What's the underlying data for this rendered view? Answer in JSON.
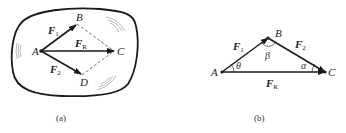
{
  "figure_a": {
    "caption": "(a)",
    "points": {
      "A": "A",
      "B": "B",
      "C": "C",
      "D": "D"
    },
    "vectors": {
      "F1": {
        "main": "F",
        "sub": "1"
      },
      "F2": {
        "main": "F",
        "sub": "2"
      },
      "FR": {
        "main": "F",
        "sub": "R"
      }
    }
  },
  "figure_b": {
    "caption": "(b)",
    "points": {
      "A": "A",
      "B": "B",
      "C": "C"
    },
    "vectors": {
      "F1": {
        "main": "F",
        "sub": "1"
      },
      "F2": {
        "main": "F",
        "sub": "2"
      },
      "FR": {
        "main": "F",
        "sub": "R"
      }
    },
    "angles": {
      "theta": "θ",
      "beta": "β",
      "alpha": "α"
    }
  },
  "colors": {
    "stroke": "#1a1a1a",
    "dashed": "#555555",
    "hatch": "#888888"
  }
}
